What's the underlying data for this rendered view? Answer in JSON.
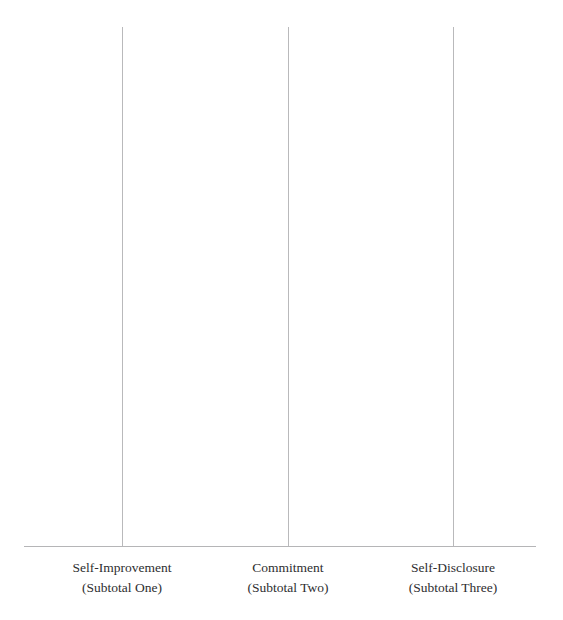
{
  "chart_data": {
    "type": "bar",
    "title": "",
    "xlabel": "",
    "ylabel": "",
    "categories": [
      "Self-Improvement",
      "Commitment",
      "Self-Disclosure"
    ],
    "category_sublabels": [
      "(Subtotal One)",
      "(Subtotal Two)",
      "(Subtotal Three)"
    ],
    "values": [
      0,
      0,
      0
    ],
    "ylim": [
      0,
      40
    ],
    "ytick_step": 5,
    "yticks": [
      "40",
      "35",
      "30",
      "25",
      "20",
      "15",
      "10",
      "5",
      "0"
    ],
    "ytick_values": [
      40,
      35,
      30,
      25,
      20,
      15,
      10,
      5,
      0
    ],
    "grid": "vertical-category-lines",
    "legend": "none",
    "colors": {
      "gridline": "#b9b9bb",
      "axis_line": "#b5b5b7",
      "tick_label": "#444446",
      "category_label": "#2e2e30",
      "background": "#ffffff"
    }
  },
  "axis": {
    "x_line_label": "baseline-axis"
  }
}
